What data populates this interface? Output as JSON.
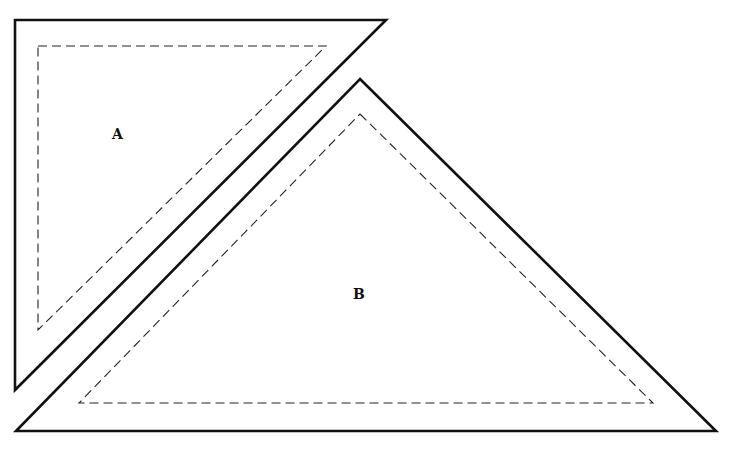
{
  "diagram": {
    "shapes": [
      {
        "id": "A",
        "label": "A",
        "outer": [
          [
            15,
            20
          ],
          [
            386,
            20
          ],
          [
            15,
            390
          ]
        ],
        "inner_dashed": [
          [
            38,
            46
          ],
          [
            326,
            46
          ],
          [
            38,
            330
          ]
        ],
        "label_pos": [
          112,
          124
        ]
      },
      {
        "id": "B",
        "label": "B",
        "outer": [
          [
            360,
            79
          ],
          [
            716,
            431
          ],
          [
            16,
            431
          ]
        ],
        "inner_dashed": [
          [
            360,
            114
          ],
          [
            653,
            403
          ],
          [
            79,
            403
          ]
        ],
        "label_pos": [
          353,
          285
        ]
      }
    ],
    "colors": {
      "stroke": "#111111",
      "background": "#ffffff"
    }
  }
}
